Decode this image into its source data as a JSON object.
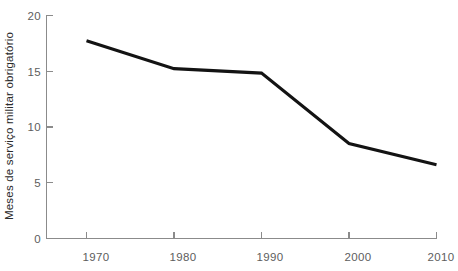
{
  "chart_data": {
    "type": "line",
    "title": "",
    "subtitle": "",
    "xlabel": "",
    "ylabel": "Meses de serviço militar obrigatório",
    "x": [
      1970,
      1980,
      1990,
      2000,
      2010
    ],
    "values": [
      17.7,
      15.2,
      14.8,
      8.5,
      6.6
    ],
    "series": [
      {
        "name": "Meses de serviço militar obrigatório",
        "values": [
          17.7,
          15.2,
          14.8,
          8.5,
          6.6
        ],
        "color": "#131313"
      }
    ],
    "xlim": [
      1970,
      2010
    ],
    "ylim": [
      0,
      20
    ],
    "xticks": [
      1970,
      1980,
      1990,
      2000,
      2010
    ],
    "yticks": [
      0,
      5,
      10,
      15,
      20
    ],
    "xtick_labels": [
      "1970",
      "1980",
      "1990",
      "2000",
      "2010"
    ],
    "ytick_labels": [
      "0",
      "5",
      "10",
      "15",
      "20"
    ],
    "grid": false,
    "legend": false,
    "legend_position": "none",
    "markers": false,
    "annotations": []
  },
  "axes": {
    "y_title": "Meses de serviço militar obrigatório",
    "x_title": "",
    "tick_color": "#5d5d5d",
    "axis_color": "#8b8b8b",
    "line_color": "#131313",
    "background": "#ffffff"
  },
  "ytick_labels": [
    {
      "text": "20",
      "value": 20
    },
    {
      "text": "15",
      "value": 15
    },
    {
      "text": "10",
      "value": 10
    },
    {
      "text": "5",
      "value": 5
    },
    {
      "text": "0",
      "value": 0
    }
  ],
  "xtick_labels": [
    {
      "text": "1970",
      "value": 1970
    },
    {
      "text": "1980",
      "value": 1980
    },
    {
      "text": "1990",
      "value": 1990
    },
    {
      "text": "2000",
      "value": 2000
    },
    {
      "text": "2010",
      "value": 2010
    }
  ]
}
